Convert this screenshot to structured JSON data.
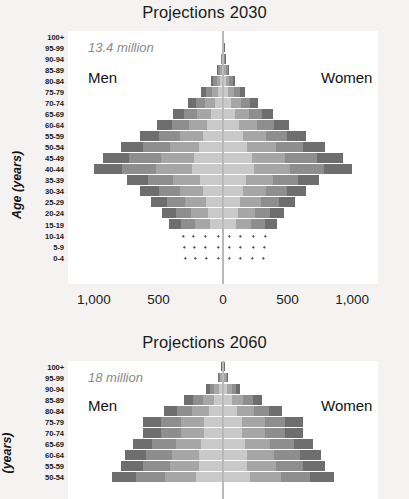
{
  "figure": {
    "background_color": "#f4f3f1",
    "plot_background_color": "#ffffff",
    "bar_colors": {
      "outer": "#6e6e6e",
      "mid": "#8e8e8e",
      "inner": "#a6a6a6",
      "core": "#c9c9c9"
    }
  },
  "panels": [
    {
      "id": "projections-2030",
      "title": "Projections 2030",
      "total_note": "13.4 million",
      "men_label": "Men",
      "women_label": "Women",
      "y_axis_title": "Age (years)",
      "x_ticks": [
        "1,000",
        "500",
        "0",
        "500",
        "1,000"
      ]
    },
    {
      "id": "projections-2060",
      "title": "Projections 2060",
      "total_note": "18 million",
      "men_label": "Men",
      "women_label": "Women",
      "y_axis_title": "(years)",
      "x_ticks": []
    }
  ],
  "chart_data": [
    {
      "type": "bar",
      "subtype": "population-pyramid",
      "title": "Projections 2030",
      "annotation": "13.4 million",
      "xlabel": "",
      "ylabel": "Age (years)",
      "xlim": [
        -1200,
        1200
      ],
      "x_tick_values": [
        -1000,
        -500,
        0,
        500,
        1000
      ],
      "x_tick_labels": [
        "1,000",
        "500",
        "0",
        "500",
        "1,000"
      ],
      "grid": false,
      "legend": "none",
      "categories": [
        "100+",
        "95-99",
        "90-94",
        "85-89",
        "80-84",
        "75-79",
        "70-74",
        "65-69",
        "60-64",
        "55-59",
        "50-54",
        "45-49",
        "40-44",
        "35-39",
        "30-34",
        "25-29",
        "20-24",
        "15-19",
        "10-14",
        "5-9",
        "0-4"
      ],
      "series": [
        {
          "name": "Men",
          "side": "left",
          "values": [
            2,
            6,
            18,
            45,
            95,
            170,
            270,
            390,
            510,
            640,
            790,
            930,
            1000,
            740,
            640,
            560,
            470,
            420,
            360,
            350,
            340
          ]
        },
        {
          "name": "Women",
          "side": "right",
          "values": [
            2,
            6,
            18,
            45,
            95,
            170,
            270,
            390,
            510,
            640,
            790,
            930,
            1000,
            740,
            640,
            560,
            470,
            420,
            360,
            350,
            340
          ]
        }
      ],
      "stippled_categories": [
        "10-14",
        "5-9",
        "0-4"
      ]
    },
    {
      "type": "bar",
      "subtype": "population-pyramid",
      "title": "Projections 2060",
      "annotation": "18 million",
      "xlabel": "",
      "ylabel": "(years)",
      "xlim": [
        -1200,
        1200
      ],
      "grid": false,
      "legend": "none",
      "note": "Panel is cropped at the bottom of the screenshot; only 100+ through 50-54 are visible.",
      "categories": [
        "100+",
        "95-99",
        "90-94",
        "85-89",
        "80-84",
        "75-79",
        "70-74",
        "65-69",
        "60-64",
        "55-59",
        "50-54"
      ],
      "series": [
        {
          "name": "Men",
          "side": "left",
          "values": [
            12,
            40,
            130,
            300,
            460,
            620,
            620,
            700,
            760,
            790,
            860
          ]
        },
        {
          "name": "Women",
          "side": "right",
          "values": [
            12,
            40,
            130,
            300,
            460,
            620,
            620,
            700,
            760,
            790,
            860
          ]
        }
      ],
      "stippled_categories": []
    }
  ]
}
